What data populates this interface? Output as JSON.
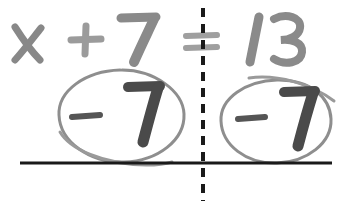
{
  "worksheet": {
    "title": "Handwritten algebra equation with balanced subtraction",
    "background_color": "#ffffff",
    "equation": {
      "variable": "x",
      "plus_operator": "+",
      "left_constant": "7",
      "equals_operator": "=",
      "right_constant": "13",
      "full_text": "x + 7 = 13",
      "ink_color": "#8a8a8a"
    },
    "operations": {
      "left_circled": {
        "sign": "-",
        "value": "7",
        "label": "-7",
        "ink_color": "#4a4a4a",
        "circle_color": "#8e8e8e"
      },
      "right_circled": {
        "sign": "-",
        "value": "7",
        "label": "-7",
        "ink_color": "#4a4a4a",
        "circle_color": "#8e8e8e"
      }
    },
    "guides": {
      "solid_rule_color": "#1a1a1a",
      "divider_color": "#1a1a1a",
      "divider_style": "dashed"
    }
  }
}
